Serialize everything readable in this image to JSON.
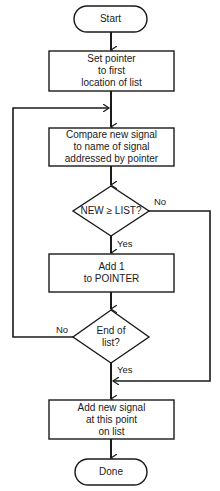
{
  "flowchart": {
    "nodes": {
      "start": {
        "type": "terminal",
        "label": "Start"
      },
      "set_pointer": {
        "type": "process",
        "label": "Set pointer\nto first\nlocation of list"
      },
      "compare": {
        "type": "process",
        "label": "Compare new signal\nto name of signal\naddressed by pointer"
      },
      "decision_new_ge_list": {
        "type": "decision",
        "label": "NEW ≥ LIST?"
      },
      "add_one": {
        "type": "process",
        "label": "Add 1\nto POINTER"
      },
      "decision_end_of_list": {
        "type": "decision",
        "label": "End of\nlist?"
      },
      "add_new_signal": {
        "type": "process",
        "label": "Add new signal\nat this point\non list"
      },
      "done": {
        "type": "terminal",
        "label": "Done"
      }
    },
    "edges": {
      "ge_yes": "Yes",
      "ge_no": "No",
      "end_no": "No",
      "end_yes": "Yes"
    },
    "colors": {
      "stroke": "#1a1a1a",
      "background": "#ffffff"
    }
  }
}
